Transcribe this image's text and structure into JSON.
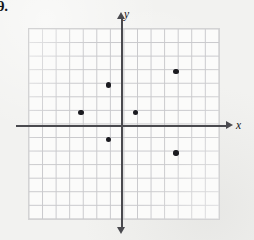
{
  "problem": {
    "number": "9."
  },
  "figure": {
    "name": "coordinate-plane-scatter",
    "axis_labels": {
      "x": "x",
      "y": "y"
    },
    "colors": {
      "grid_line": "#c9c9cc",
      "grid_background": "#fbfbfa",
      "axis": "#4a4a4f",
      "point": "#1b1b20",
      "page_background": "#f2f2f0"
    }
  },
  "chart_data": {
    "type": "scatter",
    "title": "",
    "xlabel": "x",
    "ylabel": "y",
    "grid": true,
    "legend": null,
    "xlim": [
      -7,
      7
    ],
    "ylim": [
      -7,
      7
    ],
    "xtick_step": 1,
    "ytick_step": 1,
    "tick_labels_shown": false,
    "points": [
      {
        "x": -3,
        "y": 1
      },
      {
        "x": -1,
        "y": 3
      },
      {
        "x": -1,
        "y": -1
      },
      {
        "x": 1,
        "y": 1
      },
      {
        "x": 4,
        "y": 4
      },
      {
        "x": 4,
        "y": -2
      }
    ]
  }
}
